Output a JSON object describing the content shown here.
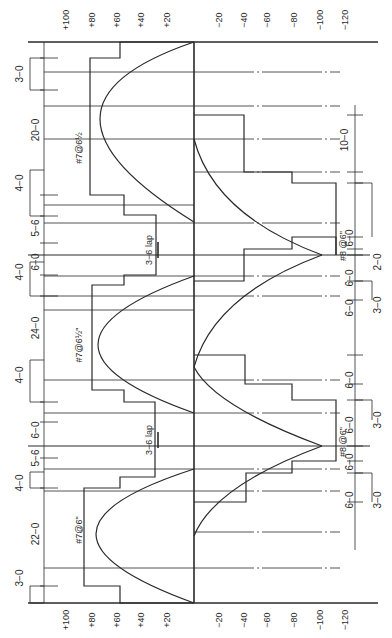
{
  "diagram": {
    "title": "",
    "orientation": "rotated-90",
    "colors": {
      "ink": "#2a2a2a",
      "paper": "#ffffff"
    },
    "axis": {
      "zero_x": 194,
      "units_per_px_note": "moment axis horizontal in page",
      "top_y": 42,
      "bottom_y": 603,
      "left_end_x": 28,
      "right_end_x": 378,
      "positive_ticks": [
        {
          "label": "+100",
          "x": 67
        },
        {
          "label": "+80",
          "x": 93
        },
        {
          "label": "+60",
          "x": 118
        },
        {
          "label": "+40",
          "x": 142
        },
        {
          "label": "+20",
          "x": 168
        }
      ],
      "negative_ticks": [
        {
          "label": "−20",
          "x": 220
        },
        {
          "label": "−40",
          "x": 245
        },
        {
          "label": "−60",
          "x": 268
        },
        {
          "label": "−80",
          "x": 295
        },
        {
          "label": "−100",
          "x": 321
        },
        {
          "label": "−120",
          "x": 346
        }
      ]
    },
    "supports": [
      {
        "name": "end-support-top",
        "y": 42
      },
      {
        "name": "interior-support-1",
        "y": 255
      },
      {
        "name": "interior-support-2",
        "y": 446
      },
      {
        "name": "end-support-bottom",
        "y": 603
      }
    ],
    "spans": [
      {
        "name": "span-1",
        "length_label": "20−0",
        "label_y": 148,
        "bar_label": "#7@6½",
        "bar_label_y": 148,
        "midline_y": 106
      },
      {
        "name": "span-2",
        "length_label": "24−0",
        "label_y": 345,
        "bar_label": "#7@6½\"",
        "bar_label_y": 345,
        "midline_y": 345
      },
      {
        "name": "span-3",
        "length_label": "22−0",
        "label_y": 530,
        "bar_label": "#7@6\"",
        "bar_label_y": 530,
        "midline_y": 532
      }
    ],
    "grid_lines_y": [
      72,
      106,
      139,
      205,
      223,
      276,
      296,
      310,
      380,
      413,
      469,
      491,
      568
    ],
    "dashed_lines_y": [
      72,
      106,
      139,
      172,
      223,
      276,
      296,
      380,
      413,
      469,
      491,
      532,
      568
    ],
    "positive_moment_curves": [
      {
        "y0": 42,
        "y1": 222,
        "peak_x": 100,
        "peak_y": 106
      },
      {
        "y0": 276,
        "y1": 413,
        "peak_x": 98,
        "peak_y": 345
      },
      {
        "y0": 469,
        "y1": 603,
        "peak_x": 96,
        "peak_y": 532
      }
    ],
    "negative_moment_curves": [
      {
        "support_y": 255,
        "peak_x": 322,
        "from_top_y": 139,
        "from_bot_y": 367
      },
      {
        "support_y": 446,
        "peak_x": 322,
        "from_top_y": 367,
        "from_bot_y": 536
      }
    ],
    "positive_steel_steps": [
      [
        [
          194,
          42
        ],
        [
          120,
          42
        ],
        [
          120,
          58
        ],
        [
          90,
          58
        ],
        [
          90,
          195
        ],
        [
          124,
          195
        ],
        [
          124,
          215
        ],
        [
          156,
          215
        ],
        [
          156,
          243
        ]
      ],
      [
        [
          156,
          243
        ],
        [
          156,
          275
        ],
        [
          124,
          275
        ],
        [
          124,
          285
        ],
        [
          92,
          285
        ],
        [
          92,
          390
        ],
        [
          124,
          390
        ],
        [
          124,
          402
        ],
        [
          155,
          402
        ],
        [
          155,
          465
        ]
      ],
      [
        [
          155,
          465
        ],
        [
          155,
          477
        ],
        [
          120,
          477
        ],
        [
          120,
          488
        ],
        [
          84,
          488
        ],
        [
          84,
          586
        ],
        [
          120,
          586
        ],
        [
          120,
          603
        ],
        [
          194,
          603
        ]
      ]
    ],
    "negative_steel_steps": [
      [
        [
          194,
          115
        ],
        [
          244,
          115
        ],
        [
          244,
          172
        ],
        [
          292,
          172
        ],
        [
          292,
          183
        ],
        [
          336,
          183
        ],
        [
          336,
          255
        ]
      ],
      [
        [
          336,
          255
        ],
        [
          336,
          237
        ],
        [
          292,
          237
        ],
        [
          292,
          249
        ],
        [
          244,
          249
        ],
        [
          244,
          281
        ],
        [
          194,
          281
        ]
      ],
      [
        [
          194,
          355
        ],
        [
          245,
          355
        ],
        [
          245,
          384
        ],
        [
          292,
          384
        ],
        [
          292,
          400
        ],
        [
          336,
          400
        ],
        [
          336,
          446
        ]
      ],
      [
        [
          336,
          446
        ],
        [
          336,
          461
        ],
        [
          292,
          461
        ],
        [
          292,
          473
        ],
        [
          246,
          473
        ],
        [
          246,
          502
        ],
        [
          194,
          502
        ]
      ]
    ],
    "left_dimensions": {
      "line_x": 44,
      "ticks": [
        {
          "y": 58
        },
        {
          "y": 90
        },
        {
          "y": 195
        },
        {
          "y": 216
        },
        {
          "y": 243
        },
        {
          "y": 275
        },
        {
          "y": 296
        },
        {
          "y": 402
        },
        {
          "y": 422
        },
        {
          "y": 458
        },
        {
          "y": 488
        },
        {
          "y": 586
        }
      ],
      "labels": [
        {
          "text": "3−0",
          "y": 74,
          "x": 20
        },
        {
          "text": "20−0",
          "y": 130,
          "x": 36
        },
        {
          "text": "4−0",
          "y": 183,
          "x": 20
        },
        {
          "text": "5−6",
          "y": 228,
          "x": 36
        },
        {
          "text": "6−0",
          "y": 262,
          "x": 36
        },
        {
          "text": "4−0",
          "y": 272,
          "x": 20
        },
        {
          "text": "24−0",
          "y": 328,
          "x": 36
        },
        {
          "text": "4−0",
          "y": 375,
          "x": 20
        },
        {
          "text": "6−0",
          "y": 430,
          "x": 36
        },
        {
          "text": "5−6",
          "y": 458,
          "x": 36
        },
        {
          "text": "4−0",
          "y": 483,
          "x": 20
        },
        {
          "text": "22−0",
          "y": 534,
          "x": 36
        },
        {
          "text": "3−0",
          "y": 578,
          "x": 20
        }
      ]
    },
    "right_dimensions": {
      "line_x": 355,
      "labels": [
        {
          "text": "10−0",
          "y": 140,
          "x": 345
        },
        {
          "text": "6−0",
          "y": 238,
          "x": 350
        },
        {
          "text": "2−0",
          "y": 262,
          "x": 378
        },
        {
          "text": "6−0",
          "y": 278,
          "x": 350
        },
        {
          "text": "3−0",
          "y": 305,
          "x": 378
        },
        {
          "text": "6−0",
          "y": 308,
          "x": 350
        },
        {
          "text": "6−0",
          "y": 380,
          "x": 350
        },
        {
          "text": "6−0",
          "y": 425,
          "x": 350
        },
        {
          "text": "3−0",
          "y": 420,
          "x": 378
        },
        {
          "text": "6−0",
          "y": 462,
          "x": 350
        },
        {
          "text": "6−0",
          "y": 500,
          "x": 350
        },
        {
          "text": "3−0",
          "y": 500,
          "x": 378
        }
      ]
    },
    "negative_bar_labels": [
      {
        "text": "#8 @6\"",
        "y": 246,
        "x": 344
      },
      {
        "text": "#8 @6\"",
        "y": 442,
        "x": 344
      }
    ],
    "lap_labels": [
      {
        "text": "3−6 lap",
        "y": 250,
        "x": 150
      },
      {
        "text": "3−6 lap",
        "y": 440,
        "x": 150
      }
    ]
  }
}
